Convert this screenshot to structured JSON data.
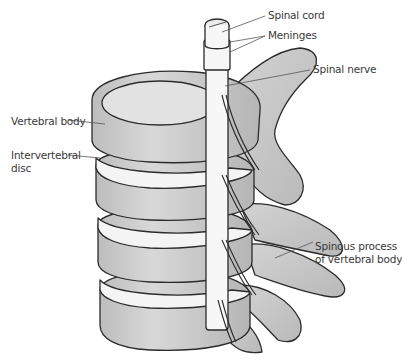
{
  "diagram": {
    "labels": {
      "spinal_cord": "Spinal cord",
      "meninges": "Meninges",
      "spinal_nerve": "Spinal nerve",
      "vertebral_body": "Vertebral body",
      "intervertebral_disc_line1": "Intervertebral",
      "intervertebral_disc_line2": "disc",
      "spinous_process_line1": "Spinous process",
      "spinous_process_line2": "of vertebral body"
    },
    "colors": {
      "bone_fill": "#c9c9c9",
      "bone_light": "#dedede",
      "bone_dark": "#a8a8a8",
      "outline": "#2b2b2b",
      "disc": "#f4f4f4",
      "cord": "#f7f7f7",
      "leader_line": "#555555",
      "text": "#3a3a3a"
    }
  }
}
